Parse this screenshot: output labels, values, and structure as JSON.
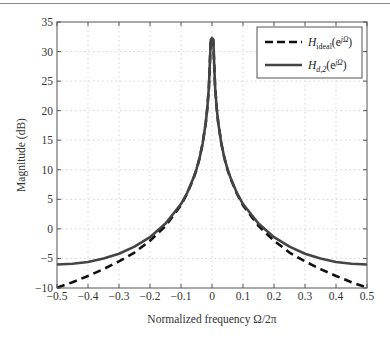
{
  "chart_data": {
    "type": "line",
    "title": "",
    "xlabel": "Normalized frequency Ω/2π",
    "ylabel": "Magnitude (dB)",
    "xlim": [
      -0.5,
      0.5
    ],
    "ylim": [
      -10,
      35
    ],
    "xticks": [
      -0.5,
      -0.4,
      -0.3,
      -0.2,
      -0.1,
      0,
      0.1,
      0.2,
      0.3,
      0.4,
      0.5
    ],
    "xtick_labels": [
      "−0.5",
      "−0.4",
      "−0.3",
      "−0.2",
      "−0.1",
      "0",
      "0.1",
      "0.2",
      "0.3",
      "0.4",
      "0.5"
    ],
    "yticks": [
      -10,
      -5,
      0,
      5,
      10,
      15,
      20,
      25,
      30,
      35
    ],
    "ytick_labels": [
      "−10",
      "−5",
      "0",
      "5",
      "10",
      "15",
      "20",
      "25",
      "30",
      "35"
    ],
    "grid": true,
    "legend_position": "upper right",
    "x": [
      -0.5,
      -0.45,
      -0.4,
      -0.35,
      -0.3,
      -0.25,
      -0.2,
      -0.15,
      -0.1,
      -0.08,
      -0.06,
      -0.05,
      -0.04,
      -0.03,
      -0.02,
      -0.015,
      -0.01,
      -0.004,
      0,
      0.004,
      0.01,
      0.015,
      0.02,
      0.03,
      0.04,
      0.05,
      0.06,
      0.08,
      0.1,
      0.15,
      0.2,
      0.25,
      0.3,
      0.35,
      0.4,
      0.45,
      0.5
    ],
    "series": [
      {
        "name": "H_ideal(e^jΩ)",
        "legend_main": "H",
        "legend_sub": "ideal",
        "legend_arg": "(e",
        "legend_sup": "jΩ",
        "legend_close": ")",
        "style": "dashed",
        "color": "#111111",
        "values": [
          -9.94,
          -9.03,
          -7.96,
          -6.8,
          -5.5,
          -4.0,
          -2.0,
          0.5,
          4.0,
          6.0,
          8.5,
          10.0,
          12.0,
          14.5,
          18.0,
          20.5,
          24.0,
          32.0,
          32.3,
          32.0,
          24.0,
          20.5,
          18.0,
          14.5,
          12.0,
          10.0,
          8.5,
          6.0,
          4.0,
          0.5,
          -2.0,
          -4.0,
          -5.5,
          -6.8,
          -7.96,
          -9.03,
          -9.94
        ]
      },
      {
        "name": "H_d,2(e^jΩ)",
        "legend_main": "H",
        "legend_sub": "d,2",
        "legend_arg": "(e",
        "legend_sup": "jΩ",
        "legend_close": ")",
        "style": "solid",
        "color": "#444444",
        "values": [
          -6.02,
          -5.9,
          -5.6,
          -5.0,
          -4.2,
          -3.0,
          -1.4,
          0.9,
          4.2,
          6.1,
          8.6,
          10.1,
          12.0,
          14.5,
          18.0,
          20.5,
          24.0,
          32.0,
          32.3,
          32.0,
          24.0,
          20.5,
          18.0,
          14.5,
          12.0,
          10.1,
          8.6,
          6.1,
          4.2,
          0.9,
          -1.4,
          -3.0,
          -4.2,
          -5.0,
          -5.6,
          -5.9,
          -6.02
        ]
      }
    ]
  }
}
